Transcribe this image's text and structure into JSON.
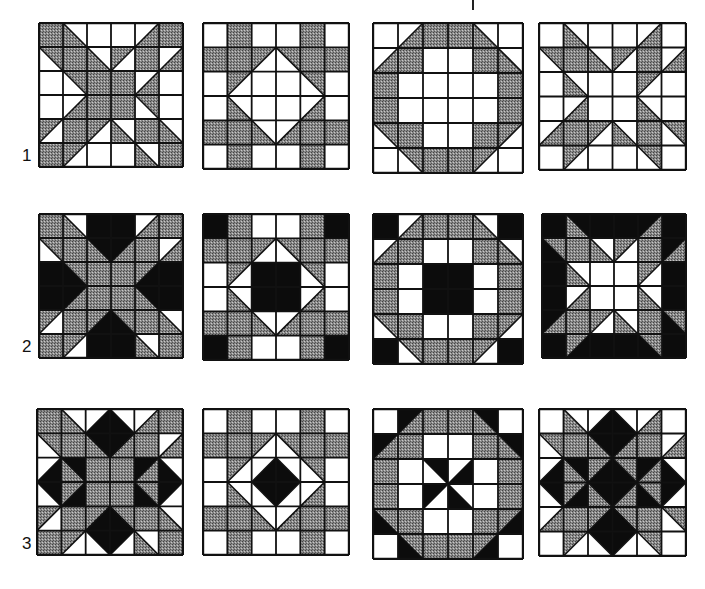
{
  "figure": {
    "title": "",
    "colors": {
      "W": "#ffffff",
      "G": "#8a8a8a",
      "B": "#0c0c0c",
      "line": "#111111"
    },
    "rows": [
      {
        "label": "1",
        "y": 22,
        "blocks": [
          {
            "name": "X star",
            "x": 38,
            "size": 144,
            "cells": [
              "G",
              "W/G:\\",
              "W",
              "W",
              "W/G:/",
              "G",
              "G/W:\\",
              "G",
              "W/G:\\",
              "G/W:/",
              "G",
              "W/G:/",
              "W",
              "G/W:\\",
              "G",
              "G",
              "W/G:/",
              "W",
              "W",
              "W/G:/",
              "G",
              "G",
              "G/W:\\",
              "W",
              "G/W:/",
              "G",
              "G/W:/",
              "W/G:\\",
              "G",
              "W/G:\\",
              "G",
              "G/W:/",
              "W",
              "W",
              "W/G:\\",
              "G"
            ]
          },
          {
            "name": "Diamond window",
            "x": 202,
            "size": 146,
            "cells": [
              "W",
              "G",
              "W",
              "W",
              "G",
              "W",
              "G",
              "G",
              "G/W:/",
              "G/W:\\",
              "G",
              "G",
              "W",
              "G/W:/",
              "W",
              "W",
              "G/W:\\",
              "W",
              "W",
              "W/G:\\",
              "W",
              "W",
              "W/G:/",
              "W",
              "G",
              "G",
              "W/G:\\",
              "W/G:/",
              "G",
              "G",
              "W",
              "G",
              "W",
              "W",
              "G",
              "W"
            ]
          },
          {
            "name": "Octagon ring",
            "x": 372,
            "size": 150,
            "cells": [
              "W",
              "W/G:/",
              "G",
              "G",
              "W/G:\\",
              "W",
              "W/G:/",
              "G",
              "W",
              "W",
              "G",
              "W/G:\\",
              "G",
              "W",
              "W",
              "W",
              "W",
              "G",
              "G",
              "W",
              "W",
              "W",
              "W",
              "G",
              "G/W:\\",
              "G",
              "W",
              "W",
              "G",
              "G/W:/",
              "W",
              "G/W:\\",
              "G",
              "G",
              "G/W:/",
              "W"
            ]
          },
          {
            "name": "Star points",
            "x": 538,
            "size": 147,
            "cells": [
              "W",
              "W/G:\\",
              "W",
              "W",
              "W/G:/",
              "W",
              "G/W:\\",
              "G",
              "W/G:\\",
              "G/W:/",
              "G",
              "W/G:/",
              "W",
              "W/G:\\",
              "W",
              "W",
              "G/W:/",
              "W",
              "W",
              "W/G:/",
              "W",
              "W",
              "W/G:\\",
              "W",
              "W/G:/",
              "G",
              "G/W:/",
              "W/G:\\",
              "G",
              "G/W:\\",
              "W",
              "G/W:/",
              "W",
              "W",
              "G/W:\\",
              "W"
            ]
          }
        ]
      },
      {
        "label": "2",
        "y": 213,
        "blocks": [
          {
            "name": "X star with black bars",
            "x": 38,
            "size": 144,
            "cells": [
              "G",
              "W/G:\\",
              "B",
              "B",
              "W/G:/",
              "G",
              "G/W:\\",
              "G",
              "B/G:\\",
              "B/G:/",
              "G",
              "W/G:/",
              "B",
              "G/B:\\",
              "G",
              "G",
              "G/B:/",
              "B",
              "B",
              "B/G:/",
              "G",
              "G",
              "B/G:\\",
              "B",
              "G/W:/",
              "G",
              "G/B:/",
              "G/B:\\",
              "G",
              "W/G:\\",
              "G",
              "G/W:/",
              "B",
              "B",
              "W/G:\\",
              "G"
            ]
          },
          {
            "name": "Diamond with black center",
            "x": 202,
            "size": 146,
            "cells": [
              "B",
              "G",
              "W",
              "W",
              "G",
              "B",
              "G",
              "G",
              "G/W:/",
              "G/W:\\",
              "G",
              "G",
              "W",
              "G/W:/",
              "B",
              "B",
              "G/W:\\",
              "W",
              "W",
              "W/G:\\",
              "B",
              "B",
              "W/G:/",
              "W",
              "G",
              "G",
              "W/G:\\",
              "W/G:/",
              "G",
              "G",
              "B",
              "G",
              "W",
              "W",
              "G",
              "B"
            ]
          },
          {
            "name": "Octagon with black center",
            "x": 372,
            "size": 150,
            "cells": [
              "B",
              "W/G:/",
              "G",
              "G",
              "W/G:\\",
              "B",
              "W/G:/",
              "G",
              "W",
              "W",
              "G",
              "W/G:\\",
              "G",
              "W",
              "B",
              "B",
              "W",
              "G",
              "G",
              "W",
              "B",
              "B",
              "W",
              "G",
              "G/W:\\",
              "G",
              "W",
              "W",
              "G",
              "G/W:/",
              "B",
              "G/W:\\",
              "G",
              "G",
              "G/W:/",
              "B"
            ]
          },
          {
            "name": "Star on black field",
            "x": 541,
            "size": 144,
            "cells": [
              "B",
              "B/G:\\",
              "B",
              "B",
              "B/G:/",
              "B",
              "G/B:\\",
              "G",
              "W/G:\\",
              "G/W:/",
              "G",
              "B/G:/",
              "B",
              "W/G:\\",
              "W",
              "W",
              "G/W:/",
              "B",
              "B",
              "W/G:/",
              "W",
              "W",
              "W/G:\\",
              "B",
              "B/G:/",
              "G",
              "G/W:/",
              "W/G:\\",
              "G",
              "G/B:\\",
              "B",
              "G/B:/",
              "B",
              "B",
              "G/B:\\",
              "B"
            ]
          }
        ]
      },
      {
        "label": "3",
        "y": 408,
        "blocks": [
          {
            "name": "X star with black diamonds",
            "x": 36,
            "size": 146,
            "cells": [
              "G",
              "W/G:\\",
              "W/B:/",
              "W/B:\\",
              "W/G:/",
              "G",
              "G/W:\\",
              "G",
              "B/G:\\",
              "B/G:/",
              "G",
              "W/G:/",
              "W/B:/",
              "B/G:\\",
              "G",
              "G",
              "B/G:/",
              "W/B:\\",
              "B/W:\\",
              "G/B:/",
              "G",
              "G",
              "G/B:\\",
              "B/W:/",
              "G/W:/",
              "G",
              "G/B:/",
              "G/B:\\",
              "G",
              "W/G:\\",
              "G",
              "G/W:/",
              "B/W:\\",
              "B/W:/",
              "W/G:\\",
              "G"
            ]
          },
          {
            "name": "Diamond in diamond",
            "x": 202,
            "size": 146,
            "cells": [
              "W",
              "G",
              "W",
              "W",
              "G",
              "W",
              "G",
              "G",
              "G/W:/",
              "G/W:\\",
              "G",
              "G",
              "W",
              "G/W:/",
              "W/B:/",
              "W/B:\\",
              "G/W:\\",
              "W",
              "W",
              "W/G:\\",
              "B/W:\\",
              "B/W:/",
              "W/G:/",
              "W",
              "G",
              "G",
              "W/G:\\",
              "W/G:/",
              "G",
              "G",
              "W",
              "G",
              "W",
              "W",
              "G",
              "W"
            ]
          },
          {
            "name": "Octagon with pinwheel",
            "x": 372,
            "size": 150,
            "cells": [
              "W",
              "B/G:/",
              "G",
              "G",
              "B/G:\\",
              "W",
              "B/G:/",
              "G",
              "W",
              "W",
              "G",
              "B/G:\\",
              "G",
              "W",
              "B/W:\\",
              "W/B:/",
              "W",
              "G",
              "G",
              "W",
              "B/W:/",
              "W/B:\\",
              "W",
              "G",
              "G/B:\\",
              "G",
              "W",
              "W",
              "G",
              "G/B:/",
              "W",
              "G/B:\\",
              "G",
              "G",
              "G/B:/",
              "W"
            ]
          },
          {
            "name": "Star with five black diamonds",
            "x": 538,
            "size": 147,
            "cells": [
              "W",
              "W/G:\\",
              "W/B:/",
              "W/B:\\",
              "W/G:/",
              "W",
              "G/W:\\",
              "G",
              "B/G:\\",
              "B/G:/",
              "G",
              "W/G:/",
              "W/B:/",
              "B/G:\\",
              "G/B:/",
              "G/B:\\",
              "B/G:/",
              "W/B:\\",
              "B/W:\\",
              "G/B:/",
              "B/G:\\",
              "B/G:/",
              "G/B:\\",
              "B/W:/",
              "W/G:/",
              "G",
              "G/B:/",
              "G/B:\\",
              "G",
              "G/W:\\",
              "W",
              "G/W:/",
              "B/W:\\",
              "B/W:/",
              "G/W:\\",
              "W"
            ]
          }
        ]
      }
    ]
  }
}
